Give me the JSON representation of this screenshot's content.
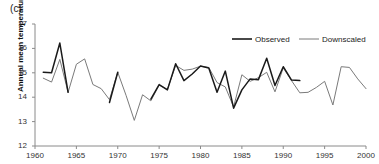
{
  "panel": {
    "label": "(c)"
  },
  "chart_data": {
    "type": "line",
    "title": "",
    "xlabel": "",
    "ylabel": "Annual mean temperature (°C)",
    "xlim": [
      1960,
      2000
    ],
    "ylim": [
      12,
      17
    ],
    "xticks": [
      1960,
      1965,
      1970,
      1975,
      1980,
      1985,
      1990,
      1995,
      2000
    ],
    "yticks": [
      12,
      13,
      14,
      15,
      16,
      17
    ],
    "grid": false,
    "legend_position": "top-right",
    "legend": [
      "Observed",
      "Downscaled"
    ],
    "colors": {
      "observed": "#1a1a1a",
      "downscaled": "#7a7a7a"
    },
    "series": [
      {
        "name": "Observed",
        "x": [
          1961,
          1962,
          1963,
          1964,
          1969,
          1970,
          1974,
          1975,
          1976,
          1977,
          1978,
          1979,
          1980,
          1981,
          1982,
          1983,
          1984,
          1985,
          1986,
          1987,
          1988,
          1989,
          1990,
          1991,
          1992
        ],
        "values": [
          15.02,
          15.0,
          16.22,
          14.2,
          13.78,
          15.02,
          13.92,
          14.52,
          14.3,
          15.37,
          14.68,
          14.95,
          15.28,
          15.2,
          14.2,
          15.07,
          13.55,
          14.3,
          14.75,
          14.72,
          15.6,
          14.48,
          15.25,
          14.7,
          14.68
        ]
      },
      {
        "name": "Downscaled",
        "x": [
          1961,
          1962,
          1963,
          1964,
          1965,
          1966,
          1967,
          1968,
          1969,
          1970,
          1971,
          1972,
          1973,
          1974,
          1975,
          1976,
          1977,
          1978,
          1979,
          1980,
          1981,
          1982,
          1983,
          1984,
          1985,
          1986,
          1987,
          1988,
          1989,
          1990,
          1991,
          1992,
          1993,
          1994,
          1995,
          1996,
          1997,
          1998,
          1999,
          2000
        ],
        "values": [
          14.78,
          14.62,
          15.55,
          14.2,
          15.35,
          15.57,
          14.52,
          14.35,
          13.9,
          15.02,
          14.08,
          13.05,
          14.1,
          13.85,
          14.5,
          14.32,
          15.3,
          15.1,
          15.15,
          15.27,
          15.22,
          14.6,
          14.42,
          13.6,
          14.92,
          14.65,
          14.8,
          15.02,
          14.22,
          15.2,
          14.68,
          14.18,
          14.2,
          14.4,
          14.65,
          13.68,
          15.25,
          15.22,
          14.75,
          14.35
        ]
      }
    ]
  },
  "legend_items": [
    {
      "label": "Observed"
    },
    {
      "label": "Downscaled"
    }
  ]
}
